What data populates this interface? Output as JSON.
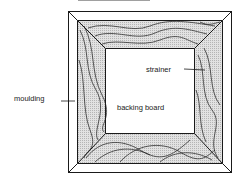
{
  "diagram": {
    "title_partial": "",
    "labels": {
      "moulding": "moulding",
      "strainer": "strainer",
      "backing_board": "backing board"
    },
    "colors": {
      "line": "#1a1a1a",
      "wood_fill": "#d4d4d4",
      "background": "#ffffff"
    }
  }
}
